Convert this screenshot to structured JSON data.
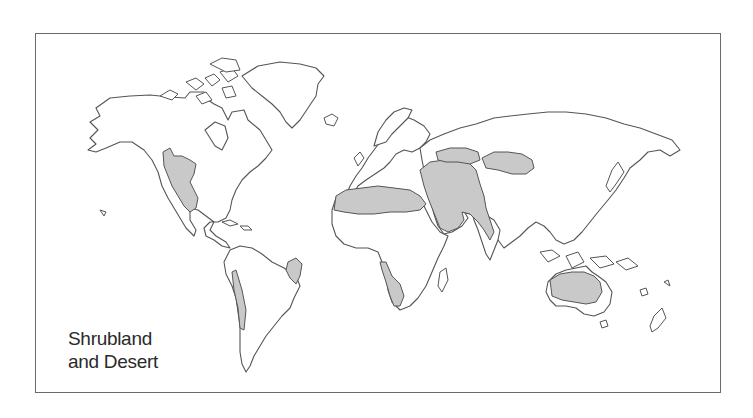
{
  "map": {
    "title": "Shrubland and Desert",
    "legend": {
      "line1": "Shrubland",
      "line2": "and Desert"
    },
    "colors": {
      "biome_fill": "#c9c9c9",
      "land_fill": "#ffffff",
      "outline": "#555555",
      "frame": "#6a6a6a"
    },
    "shaded_regions": [
      "Southwestern North America and Mexico",
      "Northeastern Brazil",
      "West coast of South America",
      "Sahara and North Africa",
      "Arabian Peninsula and Middle East",
      "Central Asia",
      "Gobi / Mongolia",
      "Southwestern Africa",
      "Interior Australia"
    ]
  }
}
